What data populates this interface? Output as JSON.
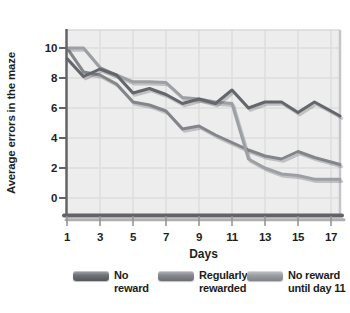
{
  "colors": {
    "background": "#ffffff",
    "plot_bg": "#ededed",
    "gridline": "#dcdcdc",
    "axis": "#636367",
    "axis_shadow": "#aeaeb1",
    "tick": "#8f8f92",
    "border_top": "#d8d8d8",
    "border_right": "#c4c6c8",
    "text": "#1f1f1f",
    "line_shadow": "rgba(80,80,85,0.28)"
  },
  "chart_data": {
    "type": "line",
    "title": "",
    "xlabel": "Days",
    "ylabel": "Average errors in the maze",
    "grid": true,
    "legend_position": "bottom",
    "x": [
      1,
      2,
      3,
      4,
      5,
      6,
      7,
      8,
      9,
      10,
      11,
      12,
      13,
      14,
      15,
      16,
      17
    ],
    "x_ticks": [
      1,
      3,
      5,
      7,
      9,
      11,
      13,
      15,
      17
    ],
    "y_ticks": [
      0,
      2,
      4,
      6,
      8,
      10
    ],
    "xlim": [
      1,
      17
    ],
    "ylim": [
      0,
      10
    ],
    "series": [
      {
        "name": "No reward",
        "legend_lines": [
          "No",
          "reward"
        ],
        "color": "#63666b",
        "swatch_top": "#a3a6aa",
        "swatch_mid": "#6d7074",
        "swatch_bottom": "#54575b",
        "values": [
          9.3,
          8.1,
          8.6,
          8.2,
          7.0,
          7.3,
          6.9,
          6.3,
          6.6,
          6.3,
          7.2,
          6.0,
          6.4,
          6.4,
          5.7,
          6.4,
          5.8
        ]
      },
      {
        "name": "Regularly rewarded",
        "legend_lines": [
          "Regularly",
          "rewarded"
        ],
        "color": "#82858a",
        "swatch_top": "#b2b5b9",
        "swatch_mid": "#85888c",
        "swatch_bottom": "#6b6e72",
        "values": [
          10.0,
          8.4,
          8.2,
          7.6,
          6.4,
          6.2,
          5.8,
          4.6,
          4.8,
          4.2,
          3.7,
          3.2,
          2.8,
          2.6,
          3.1,
          2.7,
          2.4
        ]
      },
      {
        "name": "No reward until day 11",
        "legend_lines": [
          "No reward",
          "until day 11"
        ],
        "color": "#9c9fa3",
        "swatch_top": "#c3c6c9",
        "swatch_mid": "#9a9da1",
        "swatch_bottom": "#7f8286",
        "values": [
          10.0,
          10.0,
          8.7,
          8.2,
          7.75,
          7.75,
          7.7,
          6.7,
          6.6,
          6.4,
          6.3,
          2.6,
          2.0,
          1.6,
          1.5,
          1.25,
          1.25
        ]
      }
    ]
  }
}
